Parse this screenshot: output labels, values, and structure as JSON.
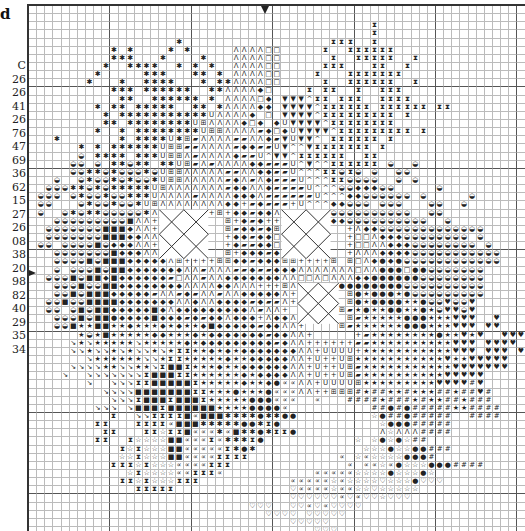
{
  "legend": {
    "title": "d",
    "header": "C",
    "numbers": [
      "26",
      "26",
      "41",
      "26",
      "76",
      "47",
      "69",
      "36",
      "62",
      "15",
      "27",
      "26",
      "08",
      "38",
      "20",
      "98",
      "82",
      "40",
      "29",
      "35",
      "34"
    ]
  },
  "chart": {
    "cell_size": 8.15,
    "cols": 62,
    "center_arrow_top_col": 29,
    "center_arrow_left_row": 32,
    "symbols": {
      ".": "",
      "*": "✱",
      "A": "Λ",
      "o": "□",
      "d": "◆",
      "v": "▼",
      "^": "^",
      "U": "U",
      "B": "⊞",
      "/": "▰",
      "I": "⧗",
      "g": "◒",
      "+": "+",
      "s": "■",
      "k": "★",
      "w": "☆",
      "h": "♥",
      "H": "♡",
      "n": "↘",
      "#": "#",
      "c": "∝",
      "e": "●"
    },
    "rows": [
      "..............................................................",
      "..............................................................",
      "..........................................I...................",
      "..........................................I...................",
      "..................*..................III..I...................",
      "..........*.*....*.*.....AAAAoo.....I..IIIIII................",
      "..........***...*....*...AAAAoo......I..IIIII..I.............",
      ".........*..****..*.*.*..AAAAoo.....III...II..I..............",
      "........*.....***...**.*.AAAAoo....I...IIIIIII...............",
      ".......*...*..****...*.**AAAAoo.....I..IIIIII..I.............",
      "..........***.******..**AAAAdo....I.II..I..III...............",
      "...........**..******.*.AAAAod.vvv^II.III..IIII..............",
      "........*.**.*****..**.*AAAAdd.vvvv^IIIIII.IIIIII.II.........",
      ".........*.***********UAAAAd.o.vvvv^IIIIIIIII.I...............",
      ".........**.********UBAAAAdod.dUvvvv^IIIIIIII.................",
      "........*..*.********UBBAAAA/dodUvvvv^IIIIIIIII.I.............",
      "...*.......*.****U*B/AAAA//AAd/vUvv^.IIIIII.I.................",
      "......*.*.******UBB//AAAA/dd//Uv^^vIIIIIII.I..................",
      "......g.****.***UBBA/AAAAd//U^vv^IIIIII..II...................",
      ".....gg.g.**g**.**UB/A/AAAAdd///U^v^^IIIIII.g..g..............",
      ".....gg**g*ggg*gUBBAAAAA//AAdd//U^^^IIgIg.g..gg...............",
      "...g..g*gg*g*gg*UBBAAAAA/dA/Ad///U^^^IIgggg..g.g..............",
      "..ggg**g*g*****UBAAAAAAA/ddAAd////U^^^ggdddgg.....g...........",
      ".ggg.g*gg*gg***UAAAA/AAAAdddA//////U^^^ddgggggg.g.....g.......",
      ".gg...g*gg*gg*UBAAAAAAAAdd+/d///+U^^^ddggg.ggg...gg..g........",
      ".g..g*g**ggggg*AA++++++B+dd/ddA///ddggggggggggg..gg...........",
      "...gggggggggsAA+........B+d/d+++++++dddgggggggggg..g..........",
      "..gggggggsssdAA+........B/dd/dB........+AddggggggggggggG.......",
      "..gggggggsssddAA+.......+dd/ddo........+ooAdddgggggggg.g.......",
      ".gg.ggggsgdddAA+........+d//ddo........+ooAAdddgggggggg.g......",
      "...gggggggsdddAAB.......B+ddd/d........+AAAddddggggggggggg.....",
      "...ggggsgsssdddddAB++++BBdd/dddBB++++B.BoAdedegggggggggggg.....",
      "...g.gggsgssdddddddAA/AAA//d//dddAAAAAAAoAAeeeoeeggggggg.......",
      "..gggsgssdsdddddd/oAA/AAdddddddAAooAoAAAddeeeeeegggggggg.......",
      "...gggsggssddddddddAAAAddAAA+++BAA+++BeeeeeeeeggggggggGg.......",
      "...ggsgsssddddd/AA/d/AA/AAdddddA+......Bekeeekeggggggggg.......",
      "..ggsggssssdddddddAAdAAdddd/d//A+......Bekeeeekkegghggh........",
      "..gg.gsgssdddddsdAdddddddddA/AA+......B/kekkeekkekghhgh........",
      "...gggsgsseddddsddd/d/ddAddd+AddAA+....B/kkkkkeeekkkhhh..h.....",
      "...ggskksskkdkkkdkdkkdsddddd/ddAA+....B/kkkkkkeeekkkhhh.hh.....",
      "......kgkskkkkkddkkkdkddddddd/ddAA+.....+/kkkkkkkkekkhkh..hhh..",
      ".....nknkkkkknkkkkkdkddddddddd/dAA++++++//kkkkkkkkkkhhh.hhhh...",
      ".....nnknnknknnknkIIkkdkdkdddddddAA+UUUU+kkkkkkkkkkkhhh.hhh.h..",
      ".......nkkkkkknnkIIkkkkkdkkdddddAA+U++UBkkkkkkkkkkkhkkhhhhh....",
      ".....nnnnkknnkknIssIkkkdkkddddddAA+U++UB/kkkkkkkkkkkhhhhhhh....",
      "....n..nnnnnnnIsssIIkkkkkkdkddddAA+U++UB/kkkkkkkkkkhhhhh.......",
      ".......n..nnnIIsssssIkkkkkdkkdeccAA+UUUUBkkkkkkkkkhhhh#h.......",
      ".........nnnnsssssssIIkkkekkkecccAA++BBB#k##kk#kkk##k##h#......",
      "..........nnnIsssIsssIkkkkkeeeccc..c...####k###k#kk##k###......",
      "........nnn.nsssIsssssskkkkeeeec..........##e#e#####kk####.....",
      "..........I..nnIIIIscsss****e**ee.........we##e#####..####.....",
      "........II...IIIIcsss*****ee*Ie............weee#####...........",
      ".........II...IIwIIsccc*cs**e*IIe..........AwAAA####...........",
      "........II..IwwwwsscccIc***Ie...........w.wewew##..............",
      "...........IwIwwwsscccccI*e*.............wwwewwee###...........",
      "...........wwIwwwssccccIIII...........c.wcwwwweee#.............",
      "..........IIIwIwwwccccIII..............c.ccwcewwweee####.......",
      "............wIwwwwccIIIc...........cccccwwwwewwwew............",
      "...........IIwIwwwIII...........cccccwcwwwwHwwweHHH...........",
      ".............IIIII..............HccccwccwwHwwwww..............",
      "................................HHHHHHcHcHHwHHH...............",
      "...........................HHH..HHcHcHHHH.....................",
      ".............................HHHH.HHHHH.......................",
      "................................HHHHH.........................",
      "...................................HHH.......................",
      ".............................................................."
    ],
    "x_diamonds": [
      {
        "col": 16,
        "row": 25,
        "w": 6,
        "h": 6
      },
      {
        "col": 31,
        "row": 25,
        "w": 6,
        "h": 6
      },
      {
        "col": 33,
        "row": 34,
        "w": 5,
        "h": 5
      }
    ]
  }
}
